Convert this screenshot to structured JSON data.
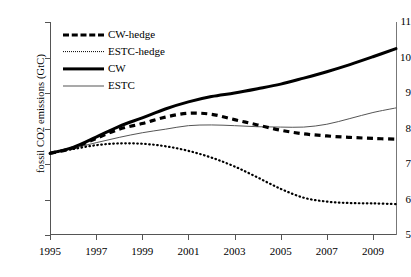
{
  "chart_data": {
    "type": "line",
    "title": "",
    "subtitle": "",
    "xlabel": "",
    "ylabel": "fossil CO2 emissions (GtC)",
    "xlim": [
      1995,
      2010
    ],
    "ylim": [
      5,
      11
    ],
    "grid": false,
    "legend_position": "top-left",
    "x_tick_labels": [
      "1995",
      "1997",
      "1999",
      "2001",
      "2003",
      "2005",
      "2007",
      "2009"
    ],
    "x_tick_values": [
      1995,
      1997,
      1999,
      2001,
      2003,
      2005,
      2007,
      2009
    ],
    "y_tick_labels": [
      "5",
      "6",
      "7",
      "8",
      "9",
      "10",
      "11"
    ],
    "y_tick_values": [
      5,
      6,
      7,
      8,
      9,
      10,
      11
    ],
    "x": [
      1995,
      1996,
      1997,
      1998,
      1999,
      2000,
      2001,
      2002,
      2003,
      2004,
      2005,
      2006,
      2007,
      2008,
      2009,
      2010
    ],
    "series": [
      {
        "name": "CW-hedge",
        "style": "thick-dashed",
        "color": "#000000",
        "values": [
          7.3,
          7.45,
          7.72,
          7.98,
          8.14,
          8.32,
          8.43,
          8.4,
          8.25,
          8.1,
          7.95,
          7.85,
          7.79,
          7.75,
          7.72,
          7.7
        ]
      },
      {
        "name": "ESTC-hedge",
        "style": "dotted",
        "color": "#000000",
        "values": [
          7.3,
          7.42,
          7.53,
          7.58,
          7.57,
          7.5,
          7.37,
          7.18,
          6.93,
          6.62,
          6.3,
          6.05,
          5.94,
          5.9,
          5.89,
          5.87
        ]
      },
      {
        "name": "CW",
        "style": "thick-solid",
        "color": "#000000",
        "values": [
          7.3,
          7.47,
          7.76,
          8.06,
          8.3,
          8.55,
          8.75,
          8.9,
          9.0,
          9.12,
          9.25,
          9.42,
          9.6,
          9.8,
          10.02,
          10.25
        ]
      },
      {
        "name": "ESTC",
        "style": "thin-solid",
        "color": "#555555",
        "values": [
          7.3,
          7.44,
          7.6,
          7.75,
          7.88,
          7.98,
          8.08,
          8.1,
          8.08,
          8.05,
          8.04,
          8.04,
          8.12,
          8.28,
          8.45,
          8.58
        ]
      }
    ]
  },
  "legend": {
    "items": [
      {
        "label": "CW-hedge"
      },
      {
        "label": "ESTC-hedge"
      },
      {
        "label": "CW"
      },
      {
        "label": "ESTC"
      }
    ]
  }
}
